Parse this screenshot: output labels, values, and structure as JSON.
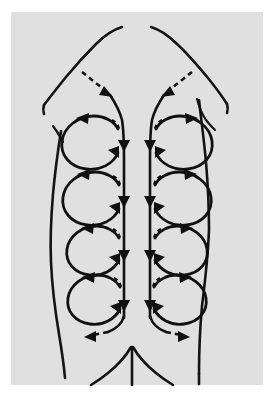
{
  "figure": {
    "title": "Back massage stroke direction diagram",
    "caption": "",
    "background_color": "#ffffff",
    "panel_color": "#e0e0e0",
    "ink_color": "#111111"
  },
  "panel": {
    "x": 11,
    "y": 12,
    "width": 252,
    "height": 373,
    "fill": "#e0e0e0"
  },
  "legend_note": "",
  "anatomy": {
    "label_body_outline": "torso outline",
    "label_left_shoulder": "left shoulder contour",
    "label_right_shoulder": "right shoulder contour",
    "label_left_flank": "left flank and waist contour",
    "label_right_flank": "right flank and waist contour",
    "label_left_scapula_edge": "left scapular border",
    "label_right_scapula_edge": "right scapular border",
    "label_gluteal_cleft": "gluteal cleft",
    "label_buttock_left": "left buttock fold",
    "label_buttock_right": "right buttock fold"
  },
  "strokes": {
    "spine_label": "paravertebral downward stroke",
    "loop_label": "circular effleurage loop",
    "lead_in_label": "dashed lead-in stroke from shoulder",
    "lead_out_label": "dashed lead-out stroke to hip",
    "spine_columns": 2,
    "loops_per_side": 4,
    "loop_rows": 4,
    "arrow_count_spine": 8,
    "direction_spine": "downward",
    "direction_loops_left": "counterclockwise",
    "direction_loops_right": "clockwise"
  },
  "geometry": {
    "spine_left_x": 123,
    "spine_right_x": 140,
    "spine_top_y": 88,
    "spine_bottom_y": 318,
    "loop_rows_y": [
      140,
      196,
      248,
      296
    ],
    "loop_left_cx": 92,
    "loop_right_cx": 171,
    "loop_rx": 36,
    "loop_ry": 27
  }
}
